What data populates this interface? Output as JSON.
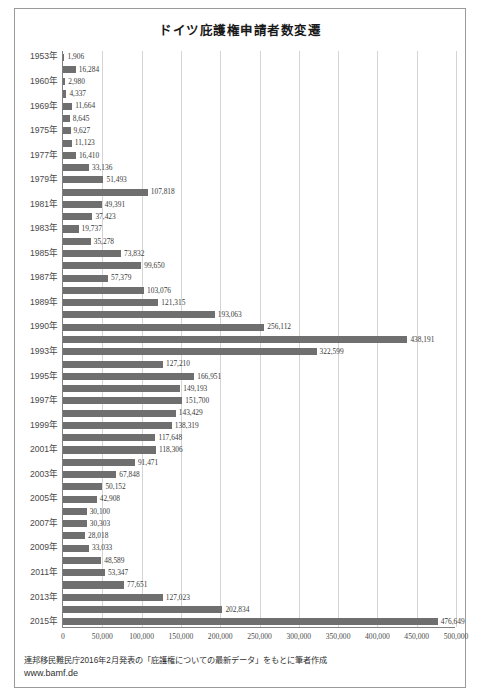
{
  "chart_data": {
    "type": "bar",
    "orientation": "horizontal",
    "title": "ドイツ庇護権申請者数変遷",
    "xlabel": "",
    "ylabel": "",
    "xlim": [
      0,
      500000
    ],
    "xticks": [
      "0",
      "50,000",
      "100,000",
      "150,000",
      "200,000",
      "250,000",
      "300,000",
      "350,000",
      "400,000",
      "450,000",
      "500,000"
    ],
    "xtick_values": [
      0,
      50000,
      100000,
      150000,
      200000,
      250000,
      300000,
      350000,
      400000,
      450000,
      500000
    ],
    "grid": true,
    "legend": null,
    "bar_color": "#6f6f6f",
    "categories": [
      "1953年",
      "",
      "1960年",
      "",
      "1969年",
      "",
      "1975年",
      "",
      "1977年",
      "",
      "1979年",
      "",
      "1981年",
      "",
      "1983年",
      "",
      "1985年",
      "",
      "1987年",
      "",
      "1989年",
      "",
      "1990年",
      "",
      "1993年",
      "",
      "1995年",
      "",
      "1997年",
      "",
      "1999年",
      "",
      "2001年",
      "",
      "2003年",
      "",
      "2005年",
      "",
      "2007年",
      "",
      "2009年",
      "",
      "2011年",
      "",
      "2013年",
      "",
      "2015年"
    ],
    "values": [
      1906,
      16284,
      2980,
      4337,
      11664,
      8645,
      9627,
      11123,
      16410,
      33136,
      51493,
      107818,
      49391,
      37423,
      19737,
      35278,
      73832,
      99650,
      57379,
      103076,
      121315,
      193063,
      256112,
      438191,
      322599,
      127210,
      166951,
      149193,
      151700,
      143429,
      138319,
      117648,
      118306,
      91471,
      67848,
      50152,
      42908,
      30100,
      30303,
      28018,
      33033,
      48589,
      53347,
      77651,
      127023,
      202834,
      476649
    ],
    "value_labels": [
      "1,906",
      "16,284",
      "2,980",
      "4,337",
      "11,664",
      "8,645",
      "9,627",
      "11,123",
      "16,410",
      "33,136",
      "51,493",
      "107,818",
      "49,391",
      "37,423",
      "19,737",
      "35,278",
      "73,832",
      "99,650",
      "57,379",
      "103,076",
      "121,315",
      "193,063",
      "256,112",
      "438,191",
      "322,599",
      "127,210",
      "166,951",
      "149,193",
      "151,700",
      "143,429",
      "138,319",
      "117,648",
      "118,306",
      "91,471",
      "67,848",
      "50,152",
      "42,908",
      "30,100",
      "30,303",
      "28,018",
      "33,033",
      "48,589",
      "53,347",
      "77,651",
      "127,023",
      "202,834",
      "476,649"
    ]
  },
  "footer": {
    "source_note": "連邦移民難民庁2016年2月発表の「庇護権についての最新データ」をもとに筆者作成",
    "url": "www.bamf.de"
  }
}
